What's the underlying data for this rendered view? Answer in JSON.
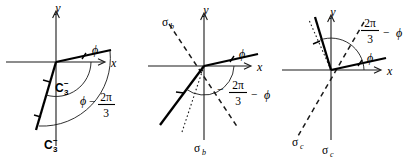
{
  "figure": {
    "type": "diagram",
    "background": "#ffffff",
    "ink_color": "#1a1a1a"
  },
  "panels": [
    {
      "id": "panel-a",
      "operation_label": "C3-",
      "axes": {
        "x": "x",
        "y": "y"
      },
      "labels": {
        "phi": "ϕ",
        "inner_arc": {
          "base": "C",
          "sub": "3",
          "sup": "−"
        },
        "outer_arc_lead": "ϕ",
        "outer_arc_minus": "−",
        "outer_arc_num": "2π",
        "outer_arc_den": "3",
        "bottom": {
          "base": "C",
          "sub": "3",
          "sup": "−"
        }
      },
      "angles_deg": {
        "phi_ray": 12,
        "image_ray": 258,
        "rotation": -120
      }
    },
    {
      "id": "panel-b",
      "operation_label": "sigma_b",
      "axes": {
        "x": "x",
        "y": "y"
      },
      "labels": {
        "phi": "ϕ",
        "mirror_top": {
          "base": "σ",
          "sub": "b"
        },
        "mirror_bottom": {
          "base": "σ",
          "sub": "b"
        },
        "expr_minus1": "−",
        "expr_num": "2π",
        "expr_den": "3",
        "expr_minus2": "−",
        "expr_phi": "ϕ"
      },
      "angles_deg": {
        "phi_ray": 12,
        "image_ray": 205,
        "mirror_line": 119
      }
    },
    {
      "id": "panel-c",
      "operation_label": "sigma_c",
      "axes": {
        "x": "x",
        "y": "y"
      },
      "labels": {
        "phi": "ϕ",
        "expr_num": "2π",
        "expr_den": "3",
        "expr_minus": "−",
        "expr_phi": "ϕ",
        "mirror_left": {
          "base": "σ",
          "sub": "c"
        },
        "mirror_bottom": {
          "base": "σ",
          "sub": "c"
        }
      },
      "angles_deg": {
        "phi_ray": 12,
        "image_ray": 100,
        "mirror_line": 56
      }
    }
  ]
}
